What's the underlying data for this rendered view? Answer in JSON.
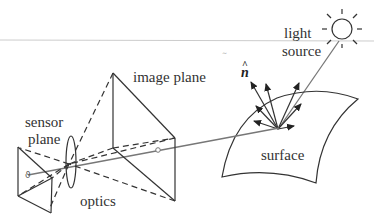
{
  "figure": {
    "labels": {
      "light": "light",
      "source": "source",
      "image_plane": "image plane",
      "sensor": "sensor",
      "sensor_plane": "plane",
      "optics": "optics",
      "surface": "surface",
      "normal": "n",
      "normal_hat": "^"
    },
    "colors": {
      "line": "#333333",
      "ray": "#777777",
      "rule": "#cccccc",
      "background": "#ffffff"
    }
  }
}
